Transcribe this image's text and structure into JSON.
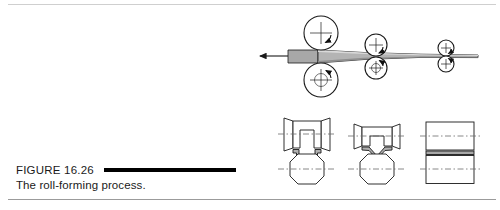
{
  "figure": {
    "label": "FIGURE 16.26",
    "caption": "The roll-forming process.",
    "rule_color": "#000000",
    "border_top_color": "#cfcfcf",
    "border_bottom_color": "#9b9b9b",
    "background": "#ffffff"
  },
  "diagram": {
    "title": "roll-forming process",
    "line_color": "#1a1a1a",
    "strip_fill": "#a8a8a8",
    "strip_fill_light": "#d6d6d6",
    "centerline_color": "#6a6a6a",
    "feed_direction": "leftward",
    "side_view": {
      "name": "roll-stand-side-view",
      "feed_arrow_label": "material travel direction",
      "roll_stands": [
        {
          "name": "roll-stand-1",
          "radius": 17,
          "top_roll": "upper-roll-1",
          "bottom_roll": "lower-roll-1",
          "rotation_top": "clockwise",
          "rotation_bottom": "counter-clockwise"
        },
        {
          "name": "roll-stand-2",
          "radius": 11,
          "top_roll": "upper-roll-2",
          "bottom_roll": "lower-roll-2",
          "rotation_top": "clockwise",
          "rotation_bottom": "counter-clockwise"
        },
        {
          "name": "roll-stand-3",
          "radius": 8,
          "top_roll": "upper-roll-3",
          "bottom_roll": "lower-roll-3",
          "rotation_top": "clockwise",
          "rotation_bottom": "counter-clockwise"
        }
      ]
    },
    "cross_sections": [
      {
        "name": "cross-section-final",
        "stage": 3,
        "description": "deep vee groove roll pair with formed channel section"
      },
      {
        "name": "cross-section-intermediate",
        "stage": 2,
        "description": "shallow bowtie roll pair with partly formed strip"
      },
      {
        "name": "cross-section-initial",
        "stage": 1,
        "description": "flat cylindrical roll pair with flat strip"
      }
    ]
  }
}
